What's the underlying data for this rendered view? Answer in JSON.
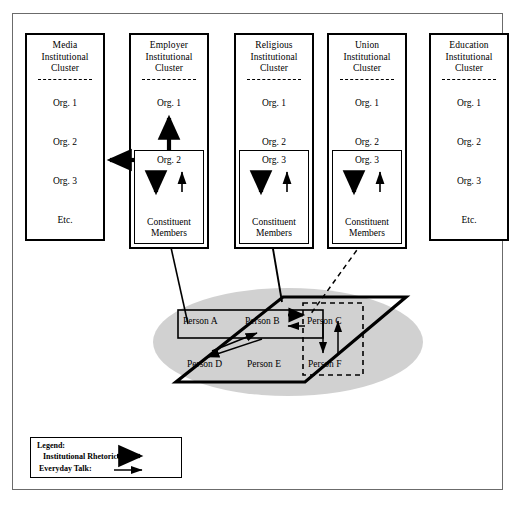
{
  "clusters": [
    {
      "id": "media",
      "title_line1": "Media",
      "title_line2": "Institutional",
      "title_line3": "Cluster",
      "items": [
        "Org. 1",
        "Org. 2",
        "Org. 3",
        "Etc."
      ],
      "has_inner_box": false
    },
    {
      "id": "employer",
      "title_line1": "Employer",
      "title_line2": "Institutional",
      "title_line3": "Cluster",
      "items": [
        "Org. 1"
      ],
      "has_inner_box": true,
      "inner_org": "Org. 2",
      "inner_members_line1": "Constituent",
      "inner_members_line2": "Members"
    },
    {
      "id": "religious",
      "title_line1": "Religious",
      "title_line2": "Institutional",
      "title_line3": "Cluster",
      "items": [
        "Org. 1",
        "Org. 2"
      ],
      "has_inner_box": true,
      "inner_org": "Org. 3",
      "inner_members_line1": "Constituent",
      "inner_members_line2": "Members"
    },
    {
      "id": "union",
      "title_line1": "Union",
      "title_line2": "Institutional",
      "title_line3": "Cluster",
      "items": [
        "Org. 1",
        "Org. 2"
      ],
      "has_inner_box": true,
      "inner_org": "Org. 3",
      "inner_members_line1": "Constituent",
      "inner_members_line2": "Members"
    },
    {
      "id": "education",
      "title_line1": "Education",
      "title_line2": "Institutional",
      "title_line3": "Cluster",
      "items": [
        "Org. 1",
        "Org. 2",
        "Org. 3",
        "Etc."
      ],
      "has_inner_box": false
    }
  ],
  "plane": {
    "persons": [
      {
        "id": "a",
        "label": "Person A"
      },
      {
        "id": "b",
        "label": "Person B"
      },
      {
        "id": "c",
        "label": "Person C"
      },
      {
        "id": "d",
        "label": "Person D"
      },
      {
        "id": "e",
        "label": "Person E"
      },
      {
        "id": "f",
        "label": "Person F"
      }
    ]
  },
  "legend": {
    "title": "Legend:",
    "rhetoric_label": "Institutional Rhetoric:",
    "everyday_label": "Everyday Talk:"
  },
  "colors": {
    "line": "#000000",
    "frame": "#6b6b6b",
    "shadow": "#c9c9c9",
    "background": "#ffffff"
  }
}
